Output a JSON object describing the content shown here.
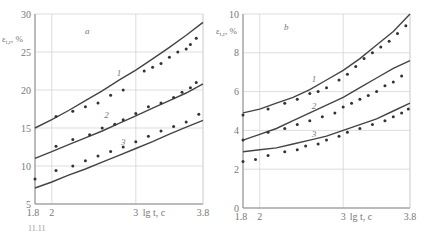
{
  "chart_data": [
    {
      "panel": "a",
      "type": "scatter",
      "title": "",
      "panel_label": "a",
      "ylabel": "ε_{t,r}, %",
      "xlabel": "lg t, c",
      "xticks": [
        "1.8",
        "2",
        "3",
        "3.8"
      ],
      "xtick_values": [
        1.8,
        2,
        3,
        3.8
      ],
      "yticks": [
        "5",
        "10",
        "15",
        "20",
        "25",
        "30"
      ],
      "ytick_values": [
        5,
        10,
        15,
        20,
        25,
        30
      ],
      "xlim": [
        1.8,
        3.8
      ],
      "ylim": [
        5,
        30
      ],
      "grid": true,
      "series": [
        {
          "name": "1",
          "curve": {
            "x": [
              1.8,
              2.0,
              2.2,
              2.4,
              2.6,
              2.8,
              3.0,
              3.2,
              3.4,
              3.6,
              3.8
            ],
            "y": [
              15.0,
              16.1,
              17.3,
              18.6,
              19.9,
              21.3,
              22.6,
              24.1,
              25.6,
              27.2,
              28.9
            ]
          },
          "points": {
            "x": [
              2.05,
              2.25,
              2.4,
              2.55,
              2.7,
              2.85,
              3.1,
              3.2,
              3.3,
              3.4,
              3.5,
              3.6,
              3.65,
              3.72
            ],
            "y": [
              16.5,
              17.2,
              17.8,
              18.3,
              19.3,
              20.0,
              22.5,
              23.0,
              23.5,
              24.3,
              25.0,
              25.4,
              26.0,
              26.8
            ]
          }
        },
        {
          "name": "2",
          "curve": {
            "x": [
              1.8,
              2.0,
              2.2,
              2.4,
              2.6,
              2.8,
              3.0,
              3.2,
              3.4,
              3.6,
              3.8
            ],
            "y": [
              11.0,
              11.9,
              12.8,
              13.7,
              14.6,
              15.6,
              16.6,
              17.6,
              18.6,
              19.6,
              20.8
            ]
          },
          "points": {
            "x": [
              2.05,
              2.25,
              2.45,
              2.6,
              2.75,
              2.85,
              3.0,
              3.15,
              3.3,
              3.45,
              3.55,
              3.65,
              3.72
            ],
            "y": [
              12.6,
              13.5,
              14.1,
              15.0,
              15.5,
              16.1,
              16.9,
              17.8,
              18.3,
              19.0,
              19.7,
              20.3,
              21.0
            ]
          }
        },
        {
          "name": "3",
          "curve": {
            "x": [
              1.8,
              2.0,
              2.2,
              2.4,
              2.6,
              2.8,
              3.0,
              3.2,
              3.4,
              3.6,
              3.8
            ],
            "y": [
              7.1,
              7.9,
              8.8,
              9.6,
              10.5,
              11.4,
              12.3,
              13.2,
              14.2,
              15.1,
              16.0
            ]
          },
          "points": {
            "x": [
              1.8,
              2.05,
              2.25,
              2.4,
              2.55,
              2.7,
              2.85,
              3.0,
              3.15,
              3.3,
              3.45,
              3.6,
              3.75
            ],
            "y": [
              8.3,
              9.4,
              10.0,
              10.7,
              11.3,
              11.9,
              12.5,
              13.2,
              13.9,
              14.6,
              15.2,
              15.8,
              16.8
            ]
          }
        }
      ],
      "curve_label_positions": [
        {
          "label": "1",
          "x": 2.8,
          "y": 21.8
        },
        {
          "label": "2",
          "x": 2.65,
          "y": 16.3
        },
        {
          "label": "3",
          "x": 2.85,
          "y": 12.8
        }
      ]
    },
    {
      "panel": "b",
      "type": "scatter",
      "title": "",
      "panel_label": "b",
      "ylabel": "ε_{t,r}, %",
      "xlabel": "lg t, c",
      "xticks": [
        "1.8",
        "2",
        "3",
        "3.8"
      ],
      "xtick_values": [
        1.8,
        2,
        3,
        3.8
      ],
      "yticks": [
        "0",
        "2",
        "4",
        "6",
        "8",
        "10"
      ],
      "ytick_values": [
        0,
        2,
        4,
        6,
        8,
        10
      ],
      "xlim": [
        1.8,
        3.8
      ],
      "ylim": [
        0,
        10
      ],
      "grid": true,
      "series": [
        {
          "name": "1",
          "curve": {
            "x": [
              1.8,
              2.0,
              2.2,
              2.4,
              2.6,
              2.8,
              3.0,
              3.2,
              3.4,
              3.6,
              3.8
            ],
            "y": [
              4.9,
              5.1,
              5.4,
              5.7,
              6.1,
              6.6,
              7.1,
              7.7,
              8.4,
              9.1,
              10.0
            ]
          },
          "points": {
            "x": [
              1.8,
              2.1,
              2.3,
              2.45,
              2.6,
              2.7,
              2.8,
              2.95,
              3.05,
              3.15,
              3.25,
              3.35,
              3.45,
              3.55,
              3.65,
              3.75
            ],
            "y": [
              4.8,
              5.1,
              5.4,
              5.6,
              5.9,
              6.0,
              6.2,
              6.6,
              6.9,
              7.3,
              7.7,
              8.0,
              8.3,
              8.6,
              9.0,
              9.4
            ]
          }
        },
        {
          "name": "2",
          "curve": {
            "x": [
              1.8,
              2.0,
              2.2,
              2.4,
              2.6,
              2.8,
              3.0,
              3.2,
              3.4,
              3.6,
              3.8
            ],
            "y": [
              3.5,
              3.8,
              4.1,
              4.5,
              4.9,
              5.3,
              5.7,
              6.2,
              6.7,
              7.2,
              7.6
            ]
          },
          "points": {
            "x": [
              1.8,
              2.1,
              2.3,
              2.45,
              2.6,
              2.75,
              2.9,
              3.0,
              3.1,
              3.2,
              3.3,
              3.4,
              3.5,
              3.6,
              3.7
            ],
            "y": [
              3.5,
              3.9,
              4.1,
              4.3,
              4.5,
              4.7,
              4.9,
              5.2,
              5.4,
              5.6,
              5.8,
              6.0,
              6.3,
              6.5,
              6.8
            ]
          }
        },
        {
          "name": "3",
          "curve": {
            "x": [
              1.8,
              2.0,
              2.2,
              2.4,
              2.6,
              2.8,
              3.0,
              3.2,
              3.4,
              3.6,
              3.8
            ],
            "y": [
              2.9,
              3.0,
              3.1,
              3.3,
              3.5,
              3.7,
              4.0,
              4.3,
              4.6,
              5.0,
              5.4
            ]
          },
          "points": {
            "x": [
              1.8,
              1.95,
              2.1,
              2.3,
              2.45,
              2.55,
              2.7,
              2.8,
              2.95,
              3.05,
              3.2,
              3.35,
              3.5,
              3.6,
              3.7,
              3.78
            ],
            "y": [
              2.4,
              2.5,
              2.7,
              2.9,
              3.0,
              3.2,
              3.3,
              3.5,
              3.7,
              3.9,
              4.1,
              4.3,
              4.5,
              4.7,
              4.9,
              5.1
            ]
          }
        }
      ],
      "curve_label_positions": [
        {
          "label": "1",
          "x": 2.65,
          "y": 6.5
        },
        {
          "label": "2",
          "x": 2.65,
          "y": 5.1
        },
        {
          "label": "3",
          "x": 2.65,
          "y": 3.65
        }
      ]
    }
  ],
  "footer_text": "11.11"
}
